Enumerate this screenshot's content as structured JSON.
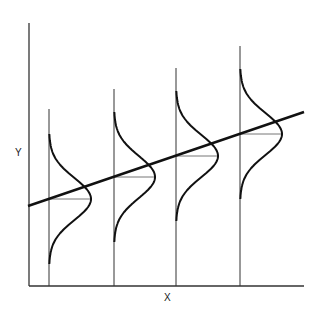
{
  "diagram": {
    "type": "regression-with-conditional-normal-distributions",
    "x_axis_label": "X",
    "y_axis_label": "Y",
    "regression_line": {
      "x1": 28,
      "y1": 206,
      "x2": 304,
      "y2": 112
    },
    "distributions": [
      {
        "x": 49,
        "top": 109,
        "mean_y": 199,
        "peak_x": 91
      },
      {
        "x": 114,
        "top": 89,
        "mean_y": 177,
        "peak_x": 155
      },
      {
        "x": 176,
        "top": 68,
        "mean_y": 156,
        "peak_x": 218
      },
      {
        "x": 240,
        "top": 46,
        "mean_y": 134,
        "peak_x": 282
      }
    ],
    "colors": {
      "axis": "#333333",
      "curve": "#111111",
      "guide": "#777777"
    }
  }
}
